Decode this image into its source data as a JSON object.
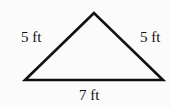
{
  "diagram": {
    "shape": "isosceles triangle",
    "labels": {
      "left_side": "5 ft",
      "right_side": "5 ft",
      "base": "7 ft"
    },
    "stroke_color": "#111111",
    "background": "#fbfbfb"
  }
}
